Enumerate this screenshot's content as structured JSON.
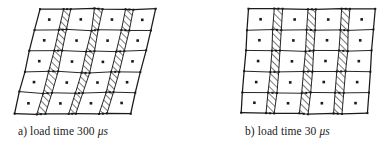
{
  "figure": {
    "kind": "finite-element-mesh-deformation",
    "background_color": "#ffffff",
    "line_color": "#1a1a1a",
    "hatch_color": "#1a1a1a",
    "node_marker": "filled-square",
    "center_marker": "filled-dot",
    "panels": [
      {
        "id": "a",
        "label_prefix": "a)",
        "caption_text": "a) load time 300 ",
        "caption_unit": "μs",
        "caption_full": "a) load time 300 μs",
        "load_time_value": "300",
        "load_time_unit": "μs",
        "mesh": {
          "columns": 7,
          "rows": 5,
          "hatched_column_indices": [
            1,
            3,
            5
          ],
          "column_width_ratios": [
            1.0,
            0.34,
            1.0,
            0.34,
            1.0,
            0.34,
            1.0
          ],
          "shear_top_offset_px": 26,
          "shear_description": "strongly sheared, top edge displaced right"
        }
      },
      {
        "id": "b",
        "label_prefix": "b)",
        "caption_text": "b) load time 30 ",
        "caption_unit": "μs",
        "caption_full": "b) load time 30 μs",
        "load_time_value": "30",
        "load_time_unit": "μs",
        "mesh": {
          "columns": 7,
          "rows": 5,
          "hatched_column_indices": [
            1,
            3,
            5
          ],
          "column_width_ratios": [
            1.0,
            0.34,
            1.0,
            0.34,
            1.0,
            0.34,
            1.0
          ],
          "shear_top_offset_px": 8,
          "shear_description": "mildly sheared, nearly rectangular"
        }
      }
    ]
  }
}
